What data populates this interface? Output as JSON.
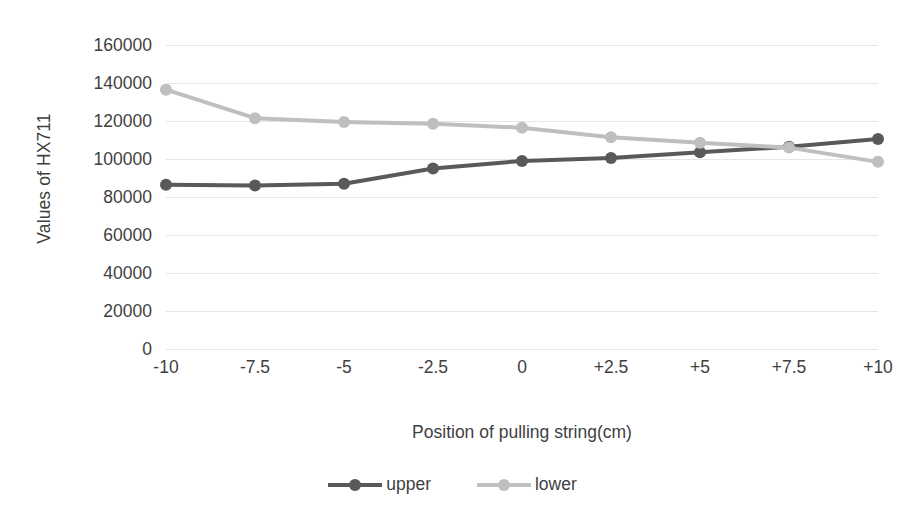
{
  "chart_data": {
    "type": "line",
    "title": "",
    "xlabel": "Position of pulling string(cm)",
    "ylabel": "Values of HX711",
    "categories": [
      "-10",
      "-7.5",
      "-5",
      "-2.5",
      "0",
      "+2.5",
      "+5",
      "+7.5",
      "+10"
    ],
    "ylim": [
      0,
      160000
    ],
    "ytick_labels": [
      "160000",
      "140000",
      "120000",
      "100000",
      "80000",
      "60000",
      "40000",
      "20000",
      "0"
    ],
    "ytick_values": [
      160000,
      140000,
      120000,
      100000,
      80000,
      60000,
      40000,
      20000,
      0
    ],
    "grid": true,
    "legend_position": "bottom",
    "series": [
      {
        "name": "upper",
        "color": "#595959",
        "values": [
          86500,
          86000,
          87000,
          95000,
          99000,
          100500,
          103500,
          106500,
          110500
        ]
      },
      {
        "name": "lower",
        "color": "#bfbfbf",
        "values": [
          136500,
          121500,
          119500,
          118500,
          116500,
          111500,
          108500,
          106000,
          98500
        ]
      }
    ]
  },
  "legend": {
    "entries": [
      {
        "label": "upper",
        "color": "#595959"
      },
      {
        "label": "lower",
        "color": "#bfbfbf"
      }
    ]
  },
  "colors": {
    "upper_series": "#595959",
    "lower_series": "#bfbfbf",
    "gridline": "#e6e6e6",
    "text": "#3f3f3f",
    "background": "#ffffff"
  }
}
